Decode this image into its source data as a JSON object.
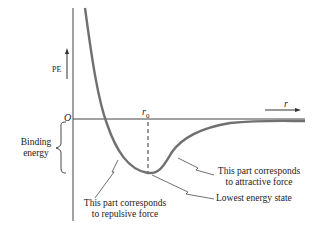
{
  "diagram": {
    "type": "potential-energy-curve",
    "y_axis_label": "PE",
    "origin_label": "O",
    "x_axis_label": "r",
    "equilibrium_label": "r",
    "equilibrium_subscript": "0",
    "binding_energy": {
      "line1": "Binding",
      "line2": "energy"
    },
    "annotations": {
      "repulsive": {
        "line1": "This part corresponds",
        "line2": "to repulsive force"
      },
      "attractive": {
        "line1": "This part corresponds",
        "line2": "to attractive force"
      },
      "lowest": "Lowest energy state"
    },
    "colors": {
      "curve": "#6e6e6e",
      "axis": "#333333"
    }
  }
}
